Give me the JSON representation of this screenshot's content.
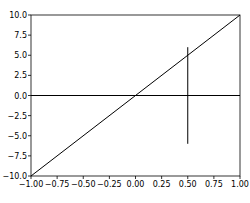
{
  "chart_data": {
    "type": "line",
    "title": "",
    "xlabel": "",
    "ylabel": "",
    "xlim": [
      -1.0,
      1.0
    ],
    "ylim": [
      -10.0,
      10.0
    ],
    "grid": false,
    "legend": null,
    "x_ticks": [
      "-1.00",
      "-0.75",
      "-0.50",
      "-0.25",
      "0.00",
      "0.25",
      "0.50",
      "0.75",
      "1.00"
    ],
    "x_tick_values": [
      -1.0,
      -0.75,
      -0.5,
      -0.25,
      0.0,
      0.25,
      0.5,
      0.75,
      1.0
    ],
    "y_ticks": [
      "10.0",
      "7.5",
      "5.0",
      "2.5",
      "0.0",
      "-2.5",
      "-5.0",
      "-7.5",
      "-10.0"
    ],
    "y_tick_values": [
      10.0,
      7.5,
      5.0,
      2.5,
      0.0,
      -2.5,
      -5.0,
      -7.5,
      -10.0
    ],
    "series": [
      {
        "name": "diagonal",
        "x": [
          -1.0,
          1.0
        ],
        "y": [
          -10.0,
          10.0
        ],
        "color": "#000000"
      },
      {
        "name": "horizontal",
        "x": [
          -1.0,
          1.0
        ],
        "y": [
          0.0,
          0.0
        ],
        "color": "#000000"
      },
      {
        "name": "vertical",
        "x": [
          0.5,
          0.5
        ],
        "y": [
          6.0,
          -6.0
        ],
        "color": "#000000"
      }
    ]
  }
}
